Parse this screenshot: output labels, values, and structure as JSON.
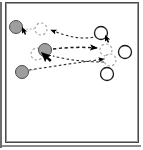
{
  "figure": {
    "title": "multi-agent tracking diagram",
    "background_color": "#ffffff",
    "frame": {
      "outer_border_color": "#4a4a4a",
      "inner_border_color": "#9a9a9a",
      "shadow_color": "#6e6e6e"
    },
    "palette": {
      "filled_marker_fill": "#9e9e9e",
      "filled_marker_stroke": "#4d4d4d",
      "open_marker_fill": "#ffffff",
      "open_marker_stroke": "#1a1a1a",
      "ghost_marker_stroke": "#a8a8a8",
      "path_color": "#2b2b2b",
      "arrow_color": "#000000",
      "pointer_color": "#000000"
    },
    "legend_note": "gray = source position, white = destination position, dashed outline = predicted position"
  },
  "chart_data": {
    "type": "scatter",
    "title": "multi-agent tracking diagram",
    "xlabel": "",
    "ylabel": "",
    "xlim": [
      0,
      143
    ],
    "ylim": [
      0,
      150
    ],
    "grid": false,
    "legend": "none",
    "series": [
      {
        "name": "source-markers",
        "style": "filled-gray-circle",
        "points": [
          {
            "id": "s1",
            "x": 16,
            "y": 27,
            "r": 6.5
          },
          {
            "id": "s2",
            "x": 45,
            "y": 50,
            "r": 6.5
          },
          {
            "id": "s3",
            "x": 22,
            "y": 72,
            "r": 6.5
          }
        ]
      },
      {
        "name": "destination-markers",
        "style": "open-white-circle",
        "points": [
          {
            "id": "d1",
            "x": 101,
            "y": 33,
            "r": 6.5
          },
          {
            "id": "d2",
            "x": 125,
            "y": 52,
            "r": 6.5
          },
          {
            "id": "d3",
            "x": 107,
            "y": 74,
            "r": 6.5
          }
        ]
      },
      {
        "name": "ghost-markers",
        "style": "dashed-outline-circle",
        "points": [
          {
            "id": "g1",
            "x": 41,
            "y": 29,
            "r": 6.0
          },
          {
            "id": "g2",
            "x": 37,
            "y": 54,
            "r": 6.0
          },
          {
            "id": "g3",
            "x": 106,
            "y": 50,
            "r": 6.0
          },
          {
            "id": "g4",
            "x": 110,
            "y": 60,
            "r": 6.0
          }
        ]
      }
    ],
    "connectors": [
      {
        "id": "c1",
        "from": "d1",
        "to": "g1",
        "style": "dashed",
        "arrow_at": "to"
      },
      {
        "id": "c2",
        "from": "s2",
        "to": "g3",
        "style": "dashed",
        "arrow_at": "to"
      },
      {
        "id": "c3",
        "from": "d3",
        "to": "s2",
        "style": "dashed",
        "arrow_at": "to"
      },
      {
        "id": "c4",
        "from": "s3",
        "to": "g4",
        "style": "dashed",
        "arrow_at": "to"
      },
      {
        "id": "c5",
        "from": "s1",
        "to": "g1",
        "style": "dotted",
        "arrow_at": "none"
      }
    ],
    "pointers": [
      {
        "id": "p1",
        "x": 25,
        "y": 31,
        "size": "small"
      },
      {
        "id": "p2",
        "x": 46,
        "y": 58,
        "size": "large"
      },
      {
        "id": "p3",
        "x": 108,
        "y": 39,
        "size": "small"
      }
    ]
  }
}
